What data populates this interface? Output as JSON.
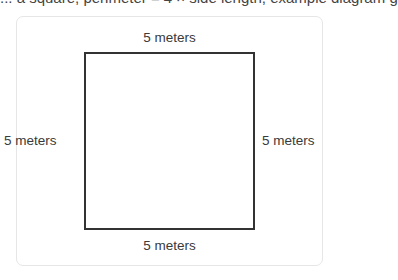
{
  "header": {
    "clipped_text": "... a square, perimeter = 4 × side length, example diagram g"
  },
  "diagram": {
    "shape": "square",
    "stroke_color": "#333333",
    "labels": {
      "top": "5 meters",
      "bottom": "5 meters",
      "left": "5 meters",
      "right": "5 meters"
    }
  }
}
